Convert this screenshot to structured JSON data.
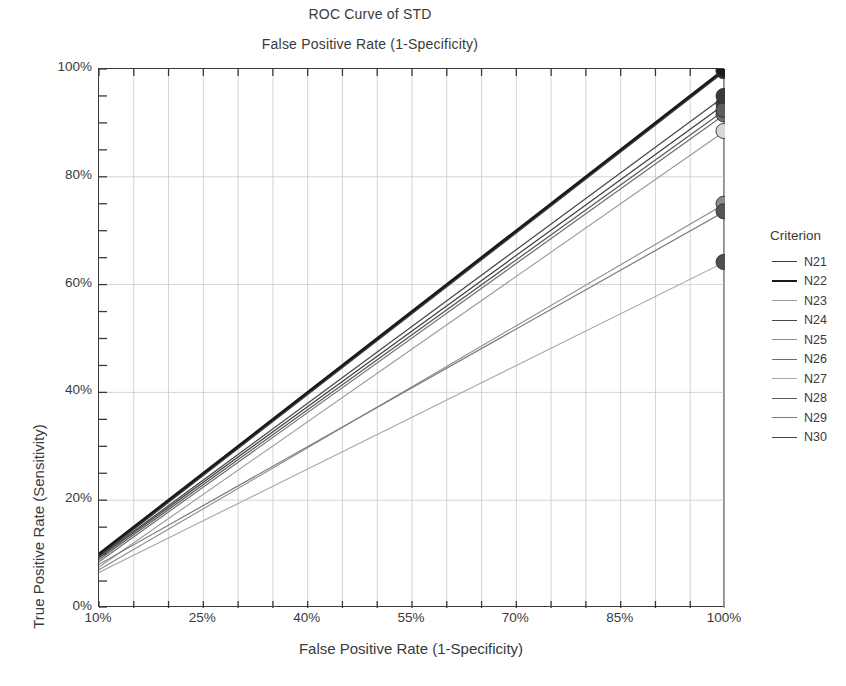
{
  "chart_data": {
    "type": "line",
    "title": "ROC Curve of STD",
    "subtitle": "False Positive Rate (1-Specificity)",
    "xlabel": "False Positive Rate (1-Specificity)",
    "ylabel": "True Positive Rate (Sensitivity)",
    "xlim": [
      10,
      100
    ],
    "ylim": [
      0,
      100
    ],
    "xticks": [
      "10%",
      "25%",
      "40%",
      "55%",
      "70%",
      "85%",
      "100%"
    ],
    "xtick_values": [
      10,
      25,
      40,
      55,
      70,
      85,
      100
    ],
    "yticks": [
      "0%",
      "20%",
      "40%",
      "60%",
      "80%",
      "100%"
    ],
    "ytick_values": [
      0,
      20,
      40,
      60,
      80,
      100
    ],
    "grid": true,
    "grid_minor_step": 5,
    "legend_title": "Criterion",
    "legend_position": "right",
    "marker": "filled-circle-at-endpoint",
    "series": [
      {
        "name": "N21",
        "color": "#3b3b3b",
        "width": 1.2,
        "x": [
          10,
          100
        ],
        "values": [
          9.3,
          93.5
        ],
        "endpoint_marker_color": "#3b3b3b"
      },
      {
        "name": "N22",
        "color": "#1a1a1a",
        "width": 2.8,
        "x": [
          10,
          100
        ],
        "values": [
          10.0,
          100.0
        ],
        "endpoint_marker_color": "#1a1a1a"
      },
      {
        "name": "N23",
        "color": "#9a9a9a",
        "width": 1.1,
        "x": [
          10,
          100
        ],
        "values": [
          7.6,
          88.5
        ],
        "endpoint_marker_color": "#d6d6d6"
      },
      {
        "name": "N24",
        "color": "#4a4a4a",
        "width": 1.4,
        "x": [
          10,
          100
        ],
        "values": [
          9.6,
          99.6
        ],
        "endpoint_marker_color": "#2a2a2a"
      },
      {
        "name": "N25",
        "color": "#8d8d8d",
        "width": 1.1,
        "x": [
          10,
          100
        ],
        "values": [
          7.1,
          75.0
        ],
        "endpoint_marker_color": "#8d8d8d"
      },
      {
        "name": "N26",
        "color": "#6e6e6e",
        "width": 1.2,
        "x": [
          10,
          100
        ],
        "values": [
          8.6,
          91.6
        ],
        "endpoint_marker_color": "#6e6e6e"
      },
      {
        "name": "N27",
        "color": "#a8a8a8",
        "width": 1.1,
        "x": [
          10,
          100
        ],
        "values": [
          6.6,
          64.2
        ],
        "endpoint_marker_color": "#4f4f4f"
      },
      {
        "name": "N28",
        "color": "#5c5c5c",
        "width": 1.3,
        "x": [
          10,
          100
        ],
        "values": [
          9.0,
          92.4
        ],
        "endpoint_marker_color": "#5c5c5c"
      },
      {
        "name": "N29",
        "color": "#7a7a7a",
        "width": 1.2,
        "x": [
          10,
          100
        ],
        "values": [
          8.1,
          73.6
        ],
        "endpoint_marker_color": "#555555"
      },
      {
        "name": "N30",
        "color": "#474747",
        "width": 1.3,
        "x": [
          10,
          100
        ],
        "values": [
          9.5,
          95.0
        ],
        "endpoint_marker_color": "#3a3a3a"
      }
    ]
  },
  "legend": {
    "title": "Criterion",
    "items": [
      "N21",
      "N22",
      "N23",
      "N24",
      "N25",
      "N26",
      "N27",
      "N28",
      "N29",
      "N30"
    ]
  },
  "axes": {
    "x_title": "False Positive Rate (1-Specificity)",
    "y_title": "True Positive Rate (Sensitivity)"
  },
  "header": {
    "title": "ROC Curve of STD",
    "subtitle": "False Positive Rate (1-Specificity)"
  },
  "colors": {
    "axis": "#3a3a3a",
    "grid": "#c9c9c9",
    "background": "#ffffff",
    "primary_curve": "#1a1a1a"
  }
}
